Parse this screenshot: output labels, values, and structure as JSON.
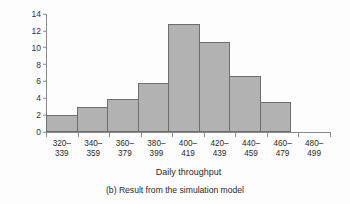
{
  "chart_data": {
    "type": "bar",
    "title": "",
    "caption": "(b) Result from the simulation model",
    "xlabel": "Daily throughput",
    "ylabel": "Frequency",
    "categories": [
      "320–339",
      "340–359",
      "360–379",
      "380–399",
      "400–419",
      "420–439",
      "440–459",
      "460–479",
      "480–499"
    ],
    "category_lines": [
      [
        "320–",
        "339"
      ],
      [
        "340–",
        "359"
      ],
      [
        "360–",
        "379"
      ],
      [
        "380–",
        "399"
      ],
      [
        "400–",
        "419"
      ],
      [
        "420–",
        "439"
      ],
      [
        "440–",
        "459"
      ],
      [
        "460–",
        "479"
      ],
      [
        "480–",
        "499"
      ]
    ],
    "values": [
      2,
      3,
      3.9,
      5.8,
      12.8,
      10.7,
      6.6,
      3.6,
      0
    ],
    "ylim": [
      0,
      14
    ],
    "yticks": [
      0,
      2,
      4,
      6,
      8,
      10,
      12,
      14
    ],
    "ytick_labels": [
      "0",
      "2",
      "4",
      "6",
      "8",
      "10",
      "12",
      "14"
    ],
    "grid": false,
    "legend": null,
    "bar_fill_color": "#b2b2b2",
    "bar_border_color": "#6e6e6e",
    "axis_color": "#8a8a8a",
    "background_color": "#fdfdfd"
  }
}
